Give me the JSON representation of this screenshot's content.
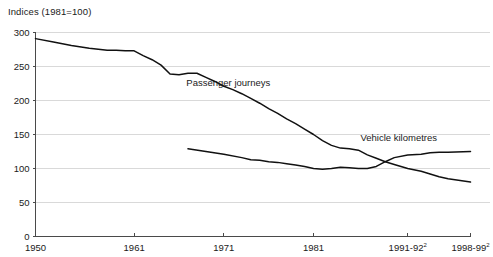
{
  "chart_data": {
    "type": "line",
    "title": "Indices (1981=100)",
    "xlabel": "",
    "ylabel": "",
    "ylim": [
      0,
      300
    ],
    "yticks": [
      0,
      50,
      100,
      150,
      200,
      250,
      300
    ],
    "ytick_labels": [
      "0",
      "50",
      "100",
      "150",
      "200",
      "250",
      "300"
    ],
    "xtick_labels": [
      "1950",
      "1961",
      "1971",
      "1981",
      "1991-92",
      "1998-99"
    ],
    "xtick_superscripts": [
      "",
      "",
      "",
      "",
      "2",
      "2"
    ],
    "xtick_positions": [
      1950,
      1961,
      1971,
      1981,
      1991.5,
      1998.5
    ],
    "grid": "horizontal",
    "legend_position": "inline-annotations",
    "annotations": [
      {
        "text": "Passenger journeys",
        "x": 1971.5,
        "y": 222
      },
      {
        "text": "Vehicle kilometres",
        "x": 1990.5,
        "y": 140
      }
    ],
    "series": [
      {
        "name": "Passenger journeys",
        "label": "Passenger journeys",
        "color": "#111111",
        "x": [
          1950,
          1952,
          1954,
          1956,
          1958,
          1959,
          1960,
          1961,
          1962,
          1963,
          1964,
          1965,
          1966,
          1967,
          1968,
          1969,
          1970,
          1971,
          1972,
          1973,
          1974,
          1975,
          1976,
          1977,
          1978,
          1979,
          1980,
          1981,
          1982,
          1983,
          1984,
          1985,
          1986,
          1987,
          1988,
          1989,
          1990,
          1991.5,
          1993,
          1994,
          1995,
          1996,
          1998.5
        ],
        "y": [
          291,
          286,
          281,
          277,
          274,
          274,
          273,
          273,
          266,
          260,
          252,
          239,
          238,
          240,
          240,
          234,
          228,
          221,
          216,
          210,
          203,
          196,
          188,
          181,
          173,
          166,
          158,
          150,
          141,
          134,
          130,
          129,
          127,
          120,
          115,
          110,
          106,
          100,
          96,
          92,
          88,
          85,
          80
        ]
      },
      {
        "name": "Vehicle kilometres",
        "label": "Vehicle kilometres",
        "color": "#111111",
        "x": [
          1967,
          1969,
          1971,
          1973,
          1974,
          1975,
          1976,
          1977,
          1978,
          1979,
          1980,
          1981,
          1982,
          1983,
          1984,
          1985,
          1986,
          1987,
          1988,
          1989,
          1990,
          1991.5,
          1993,
          1994,
          1995,
          1996,
          1998.5
        ],
        "y": [
          129,
          125,
          121,
          116,
          113,
          112,
          110,
          109,
          107,
          105,
          103,
          100,
          99,
          100,
          102,
          101,
          100,
          100,
          103,
          110,
          116,
          120,
          121,
          123,
          124,
          124,
          125
        ]
      }
    ]
  }
}
